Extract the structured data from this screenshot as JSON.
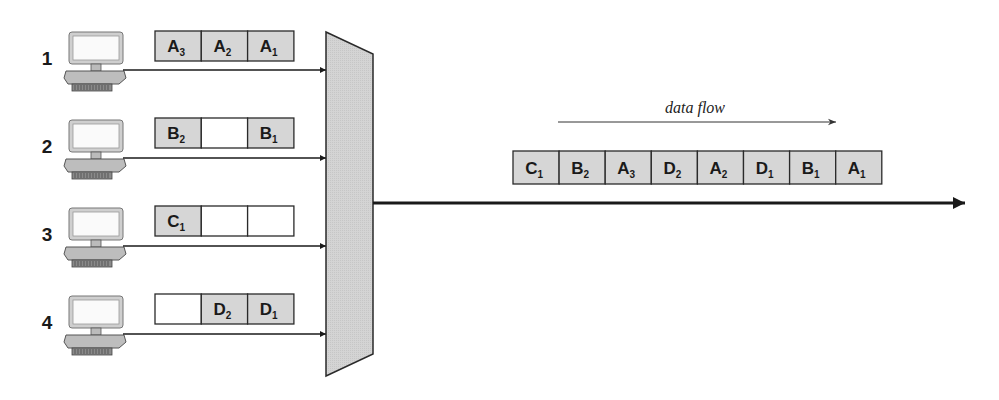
{
  "diagram": {
    "type": "time-division-multiplexing",
    "colors": {
      "filled_cell": "#d6d6d6",
      "empty_cell": "#ffffff",
      "stroke": "#2a2a2a",
      "mux": "#cfcfcf"
    },
    "sources": [
      {
        "label": "1",
        "slots": [
          {
            "letter": "A",
            "sub": "3"
          },
          {
            "letter": "A",
            "sub": "2"
          },
          {
            "letter": "A",
            "sub": "1"
          }
        ]
      },
      {
        "label": "2",
        "slots": [
          {
            "letter": "B",
            "sub": "2"
          },
          {
            "letter": "",
            "sub": ""
          },
          {
            "letter": "B",
            "sub": "1"
          }
        ]
      },
      {
        "label": "3",
        "slots": [
          {
            "letter": "C",
            "sub": "1"
          },
          {
            "letter": "",
            "sub": ""
          },
          {
            "letter": "",
            "sub": ""
          }
        ]
      },
      {
        "label": "4",
        "slots": [
          {
            "letter": "",
            "sub": ""
          },
          {
            "letter": "D",
            "sub": "2"
          },
          {
            "letter": "D",
            "sub": "1"
          }
        ]
      }
    ],
    "flow_label": "data flow",
    "output_stream": [
      {
        "letter": "C",
        "sub": "1"
      },
      {
        "letter": "B",
        "sub": "2"
      },
      {
        "letter": "A",
        "sub": "3"
      },
      {
        "letter": "D",
        "sub": "2"
      },
      {
        "letter": "A",
        "sub": "2"
      },
      {
        "letter": "D",
        "sub": "1"
      },
      {
        "letter": "B",
        "sub": "1"
      },
      {
        "letter": "A",
        "sub": "1"
      }
    ]
  }
}
